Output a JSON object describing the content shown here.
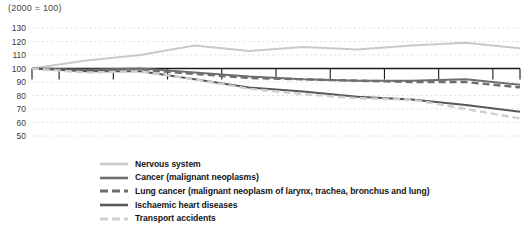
{
  "index_note": "(2000 = 100)",
  "chart_data": {
    "type": "line",
    "title": "",
    "subtitle": "(2000 = 100)",
    "xlabel": "",
    "ylabel": "",
    "grid": true,
    "legend_position": "bottom",
    "xlim": [
      2000,
      2009
    ],
    "ylim": [
      50,
      130
    ],
    "yticks": [
      50,
      60,
      70,
      80,
      90,
      100,
      110,
      120,
      130
    ],
    "categories": [
      "2000",
      "2001",
      "2002",
      "2003",
      "2004",
      "2005",
      "2006",
      "2007",
      "2008",
      "2009"
    ],
    "x": [
      2000,
      2001,
      2002,
      2003,
      2004,
      2005,
      2006,
      2007,
      2008,
      2009
    ],
    "series": [
      {
        "name": "Nervous system",
        "color": "#c9c9c9",
        "style": "solid",
        "width": 2.0,
        "values": [
          100,
          106,
          110,
          117,
          113,
          116,
          114,
          117,
          119,
          115
        ]
      },
      {
        "name": "Cancer (malignant neoplasms)",
        "color": "#6e6e6e",
        "style": "solid",
        "width": 2.0,
        "values": [
          100,
          99,
          100,
          97,
          94,
          92,
          91,
          91,
          92,
          88
        ]
      },
      {
        "name": "Lung cancer (malignant neoplasm of larynx, trachea, bronchus and lung)",
        "color": "#6e6e6e",
        "style": "dashed",
        "width": 2.4,
        "values": [
          100,
          98,
          99,
          96,
          93,
          92,
          91,
          90,
          90,
          86
        ]
      },
      {
        "name": "Ischaemic heart diseases",
        "color": "#585858",
        "style": "solid",
        "width": 2.0,
        "values": [
          100,
          98,
          98,
          92,
          86,
          83,
          79,
          77,
          73,
          68
        ]
      },
      {
        "name": "Transport accidents",
        "color": "#cfcfcf",
        "style": "dashed",
        "width": 2.4,
        "values": [
          100,
          97,
          98,
          92,
          85,
          81,
          78,
          77,
          70,
          63
        ]
      }
    ]
  },
  "legend": {
    "items": [
      {
        "label": "Nervous system"
      },
      {
        "label": "Cancer (malignant neoplasms)"
      },
      {
        "label": "Lung cancer (malignant neoplasm of larynx, trachea, bronchus and lung)"
      },
      {
        "label": "Ischaemic heart diseases"
      },
      {
        "label": "Transport accidents"
      }
    ]
  }
}
